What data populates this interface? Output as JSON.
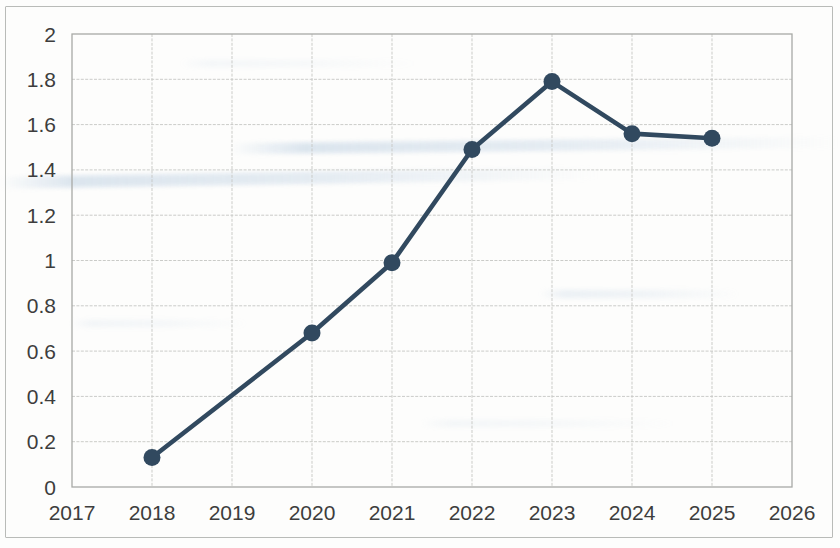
{
  "chart_data": {
    "type": "line",
    "title": "",
    "subtitle": "",
    "xlabel": "",
    "ylabel": "",
    "xlim": [
      2017,
      2026
    ],
    "ylim": [
      0,
      2
    ],
    "grid": true,
    "legend": "none",
    "series_color": "#31495f",
    "x_tick_labels": [
      "2017",
      "2018",
      "2019",
      "2020",
      "2021",
      "2022",
      "2023",
      "2024",
      "2025",
      "2026"
    ],
    "y_tick_labels": [
      "0",
      "0.2",
      "0.4",
      "0.6",
      "0.8",
      "1",
      "1.2",
      "1.4",
      "1.6",
      "1.8",
      "2"
    ],
    "x_ticks": [
      2017,
      2018,
      2019,
      2020,
      2021,
      2022,
      2023,
      2024,
      2025,
      2026
    ],
    "y_ticks": [
      0,
      0.2,
      0.4,
      0.6,
      0.8,
      1,
      1.2,
      1.4,
      1.6,
      1.8,
      2
    ],
    "series": [
      {
        "name": "series-1",
        "x": [
          2018,
          2020,
          2021,
          2022,
          2023,
          2024,
          2025
        ],
        "values": [
          0.13,
          0.68,
          0.99,
          1.49,
          1.79,
          1.56,
          1.54
        ]
      }
    ]
  },
  "figure": {
    "background_color": "#fdfdfc",
    "frame_color": "#b9bbb8",
    "gridline_color": "#c8c9c6",
    "tick_label_color": "#3d3d3d"
  }
}
